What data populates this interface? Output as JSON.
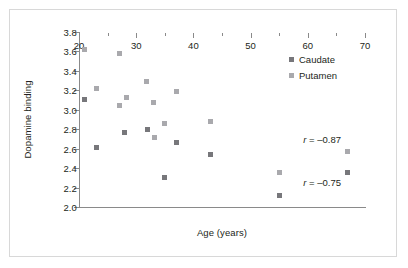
{
  "figure": {
    "background": "#ffffff",
    "border_color": "#d8d8d8"
  },
  "chart_data": {
    "type": "scatter",
    "title": "",
    "xlabel": "Age (years)",
    "ylabel": "Dopamine binding",
    "xlim": [
      20,
      70
    ],
    "ylim": [
      2.0,
      3.8
    ],
    "xticks": [
      20,
      30,
      40,
      50,
      60,
      70
    ],
    "yticks": [
      2.0,
      2.2,
      2.4,
      2.6,
      2.8,
      3.0,
      3.2,
      3.4,
      3.6,
      3.8
    ],
    "xtick_labels": [
      "20",
      "30",
      "40",
      "50",
      "60",
      "70"
    ],
    "ytick_labels": [
      "2.0",
      "2.2",
      "2.4",
      "2.6",
      "2.8",
      "3.0",
      "3.2",
      "3.4",
      "3.6",
      "3.8"
    ],
    "grid": false,
    "legend_position": "upper right",
    "series": [
      {
        "name": "Caudate",
        "color": "#77777b",
        "marker": "square",
        "points": [
          {
            "x": 21.0,
            "y": 3.11
          },
          {
            "x": 23.0,
            "y": 2.61
          },
          {
            "x": 28.0,
            "y": 2.77
          },
          {
            "x": 32.0,
            "y": 2.8
          },
          {
            "x": 35.0,
            "y": 2.3
          },
          {
            "x": 37.0,
            "y": 2.66
          },
          {
            "x": 43.0,
            "y": 2.54
          },
          {
            "x": 55.0,
            "y": 2.12
          },
          {
            "x": 67.0,
            "y": 2.36
          }
        ]
      },
      {
        "name": "Putamen",
        "color": "#a9a9ad",
        "marker": "square",
        "points": [
          {
            "x": 21.0,
            "y": 3.62
          },
          {
            "x": 23.0,
            "y": 3.22
          },
          {
            "x": 27.0,
            "y": 3.58
          },
          {
            "x": 27.0,
            "y": 3.04
          },
          {
            "x": 28.3,
            "y": 3.13
          },
          {
            "x": 31.8,
            "y": 3.29
          },
          {
            "x": 33.0,
            "y": 3.08
          },
          {
            "x": 33.2,
            "y": 2.71
          },
          {
            "x": 35.0,
            "y": 2.86
          },
          {
            "x": 37.0,
            "y": 3.19
          },
          {
            "x": 43.0,
            "y": 2.88
          },
          {
            "x": 55.0,
            "y": 2.36
          },
          {
            "x": 67.0,
            "y": 2.57
          }
        ]
      }
    ],
    "annotations": [
      {
        "text_italic": "r",
        "text": " = –0.87",
        "x": 62.5,
        "y": 2.7,
        "series": "Caudate"
      },
      {
        "text_italic": "r",
        "text": " = –0.75",
        "x": 62.5,
        "y": 2.26,
        "series": "Putamen"
      }
    ]
  },
  "legend": {
    "items": [
      {
        "label": "Caudate",
        "color": "#77777b"
      },
      {
        "label": "Putamen",
        "color": "#a9a9ad"
      }
    ]
  },
  "axis_titles": {
    "x": "Age (years)",
    "y": "Dopamine binding"
  }
}
